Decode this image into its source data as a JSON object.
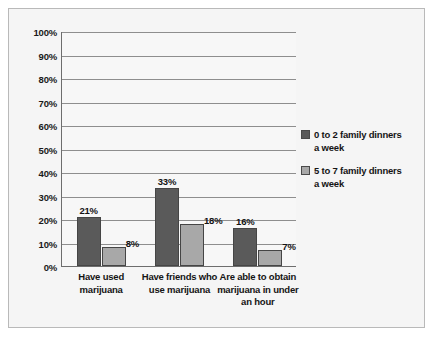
{
  "chart_data": {
    "type": "bar",
    "title": "",
    "subtitle": "",
    "xlabel": "",
    "ylabel": "",
    "ylim": [
      0,
      100
    ],
    "ytick_labels": [
      "0%",
      "10%",
      "20%",
      "30%",
      "40%",
      "50%",
      "60%",
      "70%",
      "80%",
      "90%",
      "100%"
    ],
    "ytick_values": [
      0,
      10,
      20,
      30,
      40,
      50,
      60,
      70,
      80,
      90,
      100
    ],
    "grid": true,
    "legend_position": "right",
    "categories": [
      "Have used marijuana",
      "Have friends who use marijuana",
      "Are able to obtain marijuana in under an hour"
    ],
    "category_lines": [
      [
        "Have used",
        "marijuana"
      ],
      [
        "Have friends who",
        "use marijuana"
      ],
      [
        "Are able to obtain",
        "marijuana in under",
        "an hour"
      ]
    ],
    "series": [
      {
        "name": "0 to 2 family dinners a week",
        "name_lines": [
          "0 to 2 family dinners",
          "a week"
        ],
        "color": "#5a5a5a",
        "values": [
          21,
          33,
          16
        ],
        "labels": [
          "21%",
          "33%",
          "16%"
        ]
      },
      {
        "name": "5 to 7 family dinners a week",
        "name_lines": [
          "5 to 7 family dinners",
          "a week"
        ],
        "color": "#a8a8a8",
        "values": [
          8,
          18,
          7
        ],
        "labels": [
          "8%",
          "18%",
          "7%"
        ]
      }
    ]
  },
  "colors": {
    "series_dark": "#5a5a5a",
    "series_light": "#a8a8a8",
    "background": "#f5f5f5",
    "plot_background": "#f7f7f7",
    "gridline": "#8e8e8e",
    "axis": "#6d6d6d",
    "frame_border": "#b9b9b9",
    "text": "#141414"
  }
}
